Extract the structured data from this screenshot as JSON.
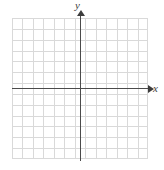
{
  "figure": {
    "x_axis_label": "x",
    "y_axis_label": "y"
  },
  "chart_data": {
    "type": "scatter",
    "title": "",
    "subtitle": "",
    "xlabel": "x",
    "ylabel": "y",
    "series": [
      {
        "name": "plotted-points",
        "x": [],
        "y": []
      }
    ],
    "xlim": [
      -6.5,
      6.5
    ],
    "ylim": [
      -6.5,
      6.5
    ],
    "x_ticks": [],
    "y_ticks": [],
    "x_tick_labels": [],
    "y_tick_labels": [],
    "grid": true,
    "grid_columns": 13,
    "grid_rows": 13,
    "grid_color": "#d9d9d9",
    "axis_color": "#4a4a4a",
    "background_color": "#ffffff",
    "legend": false,
    "legend_position": "none",
    "annotations": [],
    "origin_position": {
      "x": 80,
      "y": 88
    },
    "axis_arrows": [
      "x-positive",
      "y-positive"
    ]
  }
}
